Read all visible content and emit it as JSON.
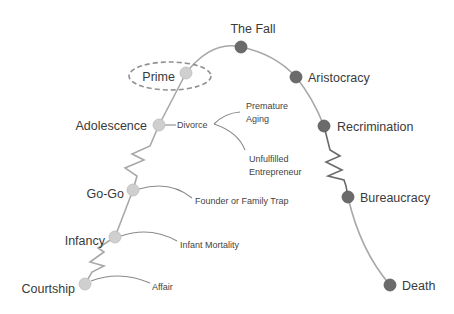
{
  "colors": {
    "growth_node": "#cfcfcf",
    "aging_node": "#6b6b6b",
    "curve": "#a8a8a8",
    "text": "#3a3a3a"
  },
  "growth_stages": [
    {
      "id": "courtship",
      "label": "Courtship"
    },
    {
      "id": "infancy",
      "label": "Infancy"
    },
    {
      "id": "go-go",
      "label": "Go-Go"
    },
    {
      "id": "adolescence",
      "label": "Adolescence"
    },
    {
      "id": "prime",
      "label": "Prime",
      "highlighted": true
    }
  ],
  "aging_stages": [
    {
      "id": "the-fall",
      "label": "The Fall"
    },
    {
      "id": "aristocracy",
      "label": "Aristocracy"
    },
    {
      "id": "recrimination",
      "label": "Recrimination"
    },
    {
      "id": "bureaucracy",
      "label": "Bureaucracy"
    },
    {
      "id": "death",
      "label": "Death"
    }
  ],
  "traps": {
    "courtship": "Affair",
    "infancy": "Infant Mortality",
    "go_go": "Founder or Family Trap",
    "adolescence": "Divorce",
    "adolescence_premature_line1": "Premature",
    "adolescence_premature_line2": "Aging",
    "adolescence_unfulfilled_line1": "Unfulfilled",
    "adolescence_unfulfilled_line2": "Entrepreneur"
  }
}
